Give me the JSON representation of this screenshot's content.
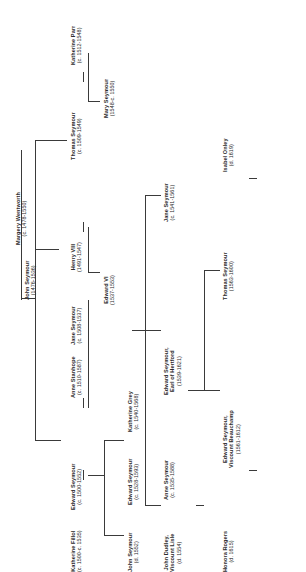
{
  "diagram": {
    "type": "family-tree",
    "orientation": "rotated-90",
    "line_color": "#3a3a3a",
    "text_color": "#2b2b2b"
  },
  "people": [
    {
      "id": "margery-wentworth",
      "name": "Margery Wentworth",
      "name2": "",
      "dates": "(c. 1478-1550)"
    },
    {
      "id": "john-seymour-1476",
      "name": "John Seymour",
      "name2": "",
      "dates": "(1476-1536)"
    },
    {
      "id": "thomas-seymour-1509",
      "name": "Thomas Seymour",
      "name2": "",
      "dates": "(c. 1509-1549)"
    },
    {
      "id": "katherine-parr",
      "name": "Katherine Parr",
      "name2": "",
      "dates": "(c. 1512-1548)"
    },
    {
      "id": "mary-seymour",
      "name": "Mary Seymour",
      "name2": "",
      "dates": "(1548-c. 1550)"
    },
    {
      "id": "henry-viii",
      "name": "Henry VIII",
      "name2": "",
      "dates": "(1491-1547)"
    },
    {
      "id": "jane-seymour-1508",
      "name": "Jane Seymour",
      "name2": "",
      "dates": "(c. 1508-1537)"
    },
    {
      "id": "edward-vi",
      "name": "Edward VI",
      "name2": "",
      "dates": "(1537-1553)"
    },
    {
      "id": "anne-stanhope",
      "name": "Anne Stanhope",
      "name2": "",
      "dates": "(c. 1510-1587)"
    },
    {
      "id": "edward-seymour-1500",
      "name": "Edward Seymour",
      "name2": "",
      "dates": "(c. 1500-1552)"
    },
    {
      "id": "katherine-fillol",
      "name": "Katherine Fillol",
      "name2": "",
      "dates": "(c. 1500-c. 1535)"
    },
    {
      "id": "edward-seymour-1528",
      "name": "Edward Seymour",
      "name2": "",
      "dates": "(c. 1528-1593)"
    },
    {
      "id": "john-seymour-1552",
      "name": "John Seymour",
      "name2": "",
      "dates": "(d. 1552)"
    },
    {
      "id": "john-dudley",
      "name": "John Dudley,",
      "name2": "Viscount Lisle",
      "dates": "(d. 1554)"
    },
    {
      "id": "anne-seymour-1535",
      "name": "Anne Seymour",
      "name2": "",
      "dates": "(c. 1535-1588)"
    },
    {
      "id": "katherine-grey",
      "name": "Katherine Grey",
      "name2": "",
      "dates": "(c. 1540-1568)"
    },
    {
      "id": "edward-seymour-hertford",
      "name": "Edward Seymour,",
      "name2": "Earl of Hertford",
      "dates": "(1539-1621)"
    },
    {
      "id": "jane-seymour-1541",
      "name": "Jane Seymour",
      "name2": "",
      "dates": "(c. 1541-1561)"
    },
    {
      "id": "thomas-seymour-1563",
      "name": "Thomas Seymour",
      "name2": "",
      "dates": "(1563-1600)"
    },
    {
      "id": "isabel-onley",
      "name": "Isabel Onley",
      "name2": "",
      "dates": "(d. 1619)"
    },
    {
      "id": "honora-rogers",
      "name": "Honora Rogers",
      "name2": "",
      "dates": "(d. 1615)"
    },
    {
      "id": "edward-seymour-beauchamp",
      "name": "Edward Seymour,",
      "name2": "Viscount Beauchamp",
      "dates": "(1561-1612)"
    }
  ]
}
